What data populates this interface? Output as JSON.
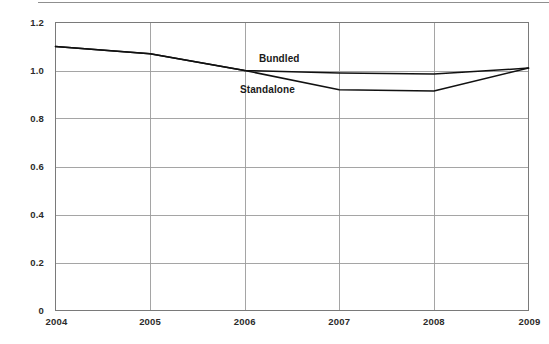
{
  "chart_data": {
    "type": "line",
    "title": "",
    "subtitle": "",
    "xlabel": "",
    "ylabel": "",
    "x": [
      "2004",
      "2005",
      "2006",
      "2007",
      "2008",
      "2009"
    ],
    "categories": [
      "2004",
      "2005",
      "2006",
      "2007",
      "2008",
      "2009"
    ],
    "xlim": [
      2004,
      2009
    ],
    "ylim": [
      0,
      1.2
    ],
    "ytick_labels": [
      "0",
      "0.2",
      "0.4",
      "0.6",
      "0.8",
      "1.0",
      "1.2"
    ],
    "ytick_values": [
      0,
      0.2,
      0.4,
      0.6,
      0.8,
      1.0,
      1.2
    ],
    "xtick_labels": [
      "2004",
      "2005",
      "2006",
      "2007",
      "2008",
      "2009"
    ],
    "grid": true,
    "grid_axis": "both",
    "legend": "inline-annotations",
    "legend_position": "inside-plot",
    "series": [
      {
        "name": "Bundled",
        "color": "#111111",
        "values": [
          1.1,
          1.07,
          1.0,
          0.99,
          0.985,
          1.01
        ]
      },
      {
        "name": "Standalone",
        "color": "#111111",
        "values": [
          1.1,
          1.07,
          1.0,
          0.92,
          0.915,
          1.01
        ]
      }
    ],
    "annotations": [
      {
        "text": "Bundled",
        "x": 2006.15,
        "y": 1.035
      },
      {
        "text": "Standalone",
        "x": 2005.95,
        "y": 0.905
      }
    ]
  },
  "axes": {
    "y_ticks": [
      {
        "label": "1.2",
        "value": 1.2
      },
      {
        "label": "1.0",
        "value": 1.0
      },
      {
        "label": "0.8",
        "value": 0.8
      },
      {
        "label": "0.6",
        "value": 0.6
      },
      {
        "label": "0.4",
        "value": 0.4
      },
      {
        "label": "0.2",
        "value": 0.2
      },
      {
        "label": "0",
        "value": 0
      }
    ],
    "x_ticks": [
      {
        "label": "2004",
        "value": 2004
      },
      {
        "label": "2005",
        "value": 2005
      },
      {
        "label": "2006",
        "value": 2006
      },
      {
        "label": "2007",
        "value": 2007
      },
      {
        "label": "2008",
        "value": 2008
      },
      {
        "label": "2009",
        "value": 2009
      }
    ]
  },
  "colors": {
    "line": "#111111",
    "grid": "#9b9b9b",
    "frame": "#7a7a7a",
    "text": "#2b2b2b",
    "background": "#ffffff"
  }
}
